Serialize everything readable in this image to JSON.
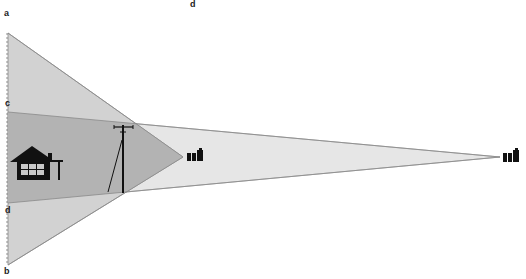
{
  "labels": {
    "a": "a",
    "b": "b",
    "c": "c",
    "d_top": "d",
    "d_left": "d"
  },
  "icons": {
    "house": "house-icon",
    "pole": "utility-pole-icon",
    "camera_near": "camera-icon",
    "camera_far": "camera-icon"
  },
  "colors": {
    "wide_field": "#d0d0d0",
    "narrow_field": "#e6e6e6",
    "overlap": "#b0b0b0",
    "edge": "#888888",
    "icon": "#111111"
  }
}
